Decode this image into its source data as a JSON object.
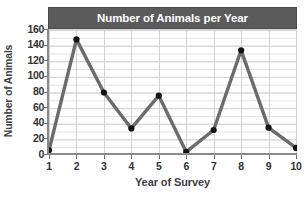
{
  "chart_data": {
    "type": "line",
    "title": "Number of Animals per Year",
    "xlabel": "Year of Survey",
    "ylabel": "Number of Animals",
    "x": [
      1,
      2,
      3,
      4,
      5,
      6,
      7,
      8,
      9,
      10
    ],
    "values": [
      6,
      148,
      80,
      34,
      76,
      4,
      32,
      134,
      35,
      9
    ],
    "xtick_labels": [
      "1",
      "2",
      "3",
      "4",
      "5",
      "6",
      "7",
      "8",
      "9",
      "10"
    ],
    "ytick_labels": [
      "0",
      "20",
      "40",
      "60",
      "80",
      "100",
      "120",
      "140",
      "160"
    ],
    "ytick_values": [
      0,
      20,
      40,
      60,
      80,
      100,
      120,
      140,
      160
    ],
    "ylim": [
      0,
      160
    ],
    "xlim": [
      1,
      10
    ],
    "grid": true,
    "grid_minor_step": 10,
    "legend": "none",
    "marker": "circle",
    "series_color": "#6b6b6b",
    "marker_color": "#141414",
    "title_band_color": "#5b5b5b",
    "title_text_color": "#ffffff",
    "grid_color": "#dcdcdc",
    "axis_color": "#8a8a8a",
    "background_color": "#ffffff"
  }
}
